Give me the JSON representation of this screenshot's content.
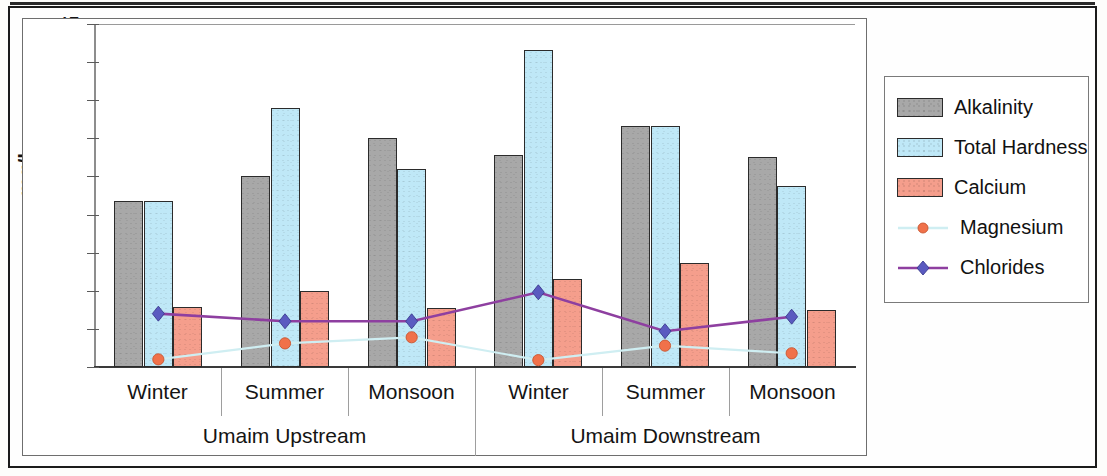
{
  "chart_data": {
    "type": "bar",
    "title": "",
    "xlabel": "",
    "ylabel": "mg/l",
    "ylim": [
      0,
      45
    ],
    "yticks": [
      0,
      5,
      10,
      15,
      20,
      25,
      30,
      35,
      40,
      45
    ],
    "ytick_labels": [
      "0",
      "5",
      "10",
      "15",
      "20",
      "25",
      "30",
      "35",
      "40",
      "45"
    ],
    "grid": false,
    "legend_position": "right",
    "categories": [
      "Winter",
      "Summer",
      "Monsoon",
      "Winter",
      "Summer",
      "Monsoon"
    ],
    "groups": [
      {
        "label": "Umaim Upstream",
        "categories": [
          "Winter",
          "Summer",
          "Monsoon"
        ]
      },
      {
        "label": "Umaim Downstream",
        "categories": [
          "Winter",
          "Summer",
          "Monsoon"
        ]
      }
    ],
    "series": [
      {
        "name": "Alkalinity",
        "kind": "bar",
        "color": "#a8a8a8",
        "values": [
          21.8,
          25.0,
          30.0,
          27.8,
          31.6,
          27.6
        ]
      },
      {
        "name": "Total Hardness",
        "kind": "bar",
        "color": "#bfe8f7",
        "values": [
          21.8,
          34.0,
          26.0,
          41.6,
          31.6,
          23.7
        ]
      },
      {
        "name": "Calcium",
        "kind": "bar",
        "color": "#f59e8c",
        "values": [
          7.9,
          10.0,
          7.8,
          11.6,
          13.7,
          7.5
        ]
      },
      {
        "name": "Magnesium",
        "kind": "line",
        "color": "#cfeef2",
        "marker_color": "#f0714a",
        "marker": "circle",
        "values": [
          1.0,
          3.1,
          3.9,
          0.9,
          2.8,
          1.8
        ]
      },
      {
        "name": "Chlorides",
        "kind": "line",
        "color": "#8e3fa0",
        "marker_color": "#5a5ac0",
        "marker": "diamond",
        "values": [
          7.0,
          6.0,
          6.0,
          9.8,
          4.7,
          6.6
        ]
      }
    ]
  },
  "axis": {
    "y_title": "mg/l",
    "ticks": [
      "45",
      "40",
      "35",
      "30",
      "25",
      "20",
      "15",
      "10",
      "5",
      "0"
    ]
  },
  "categories": {
    "labels": [
      "Winter",
      "Summer",
      "Monsoon",
      "Winter",
      "Summer",
      "Monsoon"
    ]
  },
  "groups": {
    "labels": [
      "Umaim Upstream",
      "Umaim Downstream"
    ]
  },
  "legend": {
    "items": [
      {
        "label": "Alkalinity",
        "type": "swatch",
        "color": "#a8a8a8"
      },
      {
        "label": "Total Hardness",
        "type": "swatch",
        "color": "#bfe8f7"
      },
      {
        "label": "Calcium",
        "type": "swatch",
        "color": "#f59e8c"
      },
      {
        "label": "Magnesium",
        "type": "line",
        "color": "#cfeef2",
        "marker_color": "#f0714a"
      },
      {
        "label": "Chlorides",
        "type": "line",
        "color": "#8e3fa0",
        "marker_color": "#5a5ac0"
      }
    ]
  }
}
